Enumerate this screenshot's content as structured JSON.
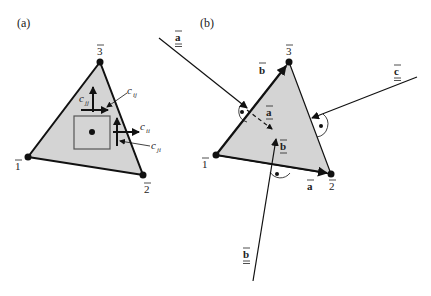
{
  "panel_a": {
    "label": "(a)",
    "vertices": [
      {
        "id": "v1",
        "label": "1",
        "x": 28,
        "y": 157
      },
      {
        "id": "v2",
        "label": "2",
        "x": 143,
        "y": 175
      },
      {
        "id": "v3",
        "label": "3",
        "x": 100,
        "y": 62
      }
    ],
    "fluxes": {
      "c_jj": "c",
      "c_jj_sub": "jj",
      "c_ij": "c",
      "c_ij_sub": "ij",
      "c_ii": "c",
      "c_ii_sub": "ii",
      "c_ji": "c",
      "c_ji_sub": "ji"
    }
  },
  "panel_b": {
    "label": "(b)",
    "vertices": [
      {
        "id": "v1",
        "label": "1",
        "x": 216,
        "y": 155
      },
      {
        "id": "v2",
        "label": "2",
        "x": 331,
        "y": 174
      },
      {
        "id": "v3",
        "label": "3",
        "x": 289,
        "y": 62
      }
    ],
    "edge_labels": {
      "a_edge": "a",
      "b_edge": "b"
    },
    "external_vectors": {
      "a_outer": "a",
      "b_outer": "b",
      "c_outer": "c"
    },
    "inner_labels": {
      "a_inner": "a",
      "b_inner": "b"
    }
  },
  "colors": {
    "triangle_fill": "#d4d4d4",
    "stroke": "#111111",
    "square_stroke": "#555555"
  }
}
